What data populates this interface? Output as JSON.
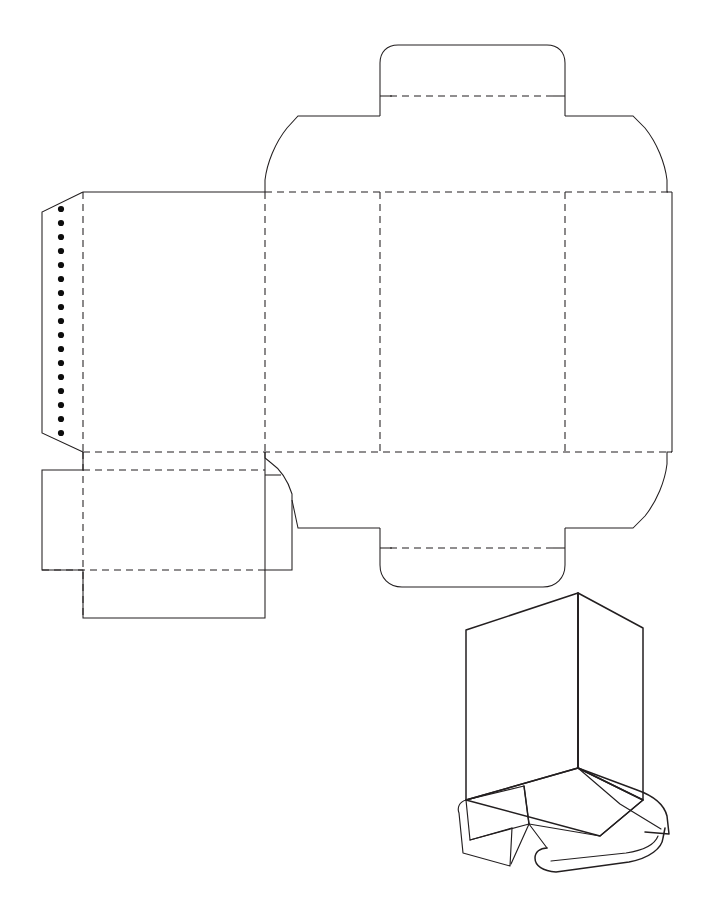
{
  "document": {
    "title": "Carton Dieline Drawing",
    "description": "Flat folding-carton dieline with perforated glue flap and an isometric assembly view",
    "canvas": {
      "width": 713,
      "height": 898
    },
    "background_color": "#ffffff",
    "line_color": "#231f20"
  },
  "legend": {
    "cut_line_label": "Cut line (solid)",
    "crease_line_label": "Crease / fold line (dashed)",
    "perforation_label": "Perforation dots"
  },
  "dieline": {
    "name": "flat-dieline",
    "panels": [
      {
        "id": "glue-flap",
        "label": "Glue Flap",
        "x": 42,
        "y": 192,
        "w": 41,
        "h": 260
      },
      {
        "id": "back-panel",
        "label": "Back Panel",
        "x": 83,
        "y": 192,
        "w": 182,
        "h": 260
      },
      {
        "id": "left-side-panel",
        "label": "Left Side Panel",
        "x": 265,
        "y": 192,
        "w": 115,
        "h": 260
      },
      {
        "id": "front-panel",
        "label": "Front Panel",
        "x": 380,
        "y": 192,
        "w": 185,
        "h": 260
      },
      {
        "id": "right-side-panel",
        "label": "Right Side Panel",
        "x": 565,
        "y": 192,
        "w": 107,
        "h": 260
      }
    ],
    "flaps": [
      {
        "id": "top-tuck-flap",
        "label": "Top Tuck Flap",
        "position": "top-center"
      },
      {
        "id": "top-left-dust-flap",
        "label": "Top Left Dust Flap",
        "position": "top-left"
      },
      {
        "id": "top-right-dust-flap",
        "label": "Top Right Dust Flap",
        "position": "top-right"
      },
      {
        "id": "bottom-tuck-flap",
        "label": "Bottom Tuck Flap",
        "position": "bottom-center"
      },
      {
        "id": "bottom-left-flap",
        "label": "Bottom Left Flap",
        "position": "bottom-left"
      },
      {
        "id": "bottom-right-dust-flap",
        "label": "Bottom Right Dust Flap",
        "position": "bottom-right"
      }
    ],
    "perforation": {
      "count": 17,
      "x": 61,
      "y_start": 209,
      "y_end": 433,
      "dot_radius": 3.1,
      "color": "#0d0d0d"
    },
    "fold_lines_vertical_x": [
      83,
      265,
      380,
      565,
      672
    ],
    "fold_lines_horizontal_y": [
      192,
      452
    ]
  },
  "isometric_view": {
    "name": "assembled-carton-view",
    "label": "Assembled carton, bottom open",
    "origin": {
      "x": 455,
      "y": 580
    },
    "size": {
      "w": 245,
      "h": 290
    }
  }
}
